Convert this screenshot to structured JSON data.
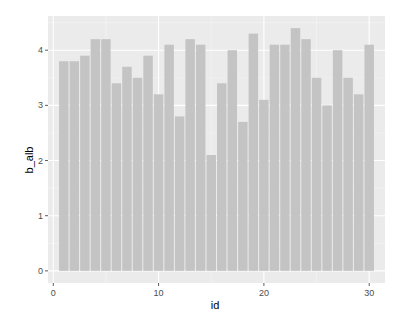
{
  "chart_data": {
    "type": "bar",
    "title": "",
    "xlabel": "id",
    "ylabel": "b_alb",
    "x": [
      1,
      2,
      3,
      4,
      5,
      6,
      7,
      8,
      9,
      10,
      11,
      12,
      13,
      14,
      15,
      16,
      17,
      18,
      19,
      20,
      21,
      22,
      23,
      24,
      25,
      26,
      27,
      28,
      29,
      30
    ],
    "values": [
      3.8,
      3.8,
      3.9,
      4.2,
      4.2,
      3.4,
      3.7,
      3.5,
      3.9,
      3.2,
      4.1,
      2.8,
      4.2,
      4.1,
      2.1,
      3.4,
      4.0,
      2.7,
      4.3,
      3.1,
      4.1,
      4.1,
      4.4,
      4.2,
      3.5,
      3.0,
      4.0,
      3.5,
      3.2,
      4.1
    ],
    "xlim": [
      -0.5,
      31.5
    ],
    "ylim": [
      -0.22,
      4.62
    ],
    "xticks": [
      0,
      10,
      20,
      30
    ],
    "xtick_labels": [
      "0",
      "10",
      "20",
      "30"
    ],
    "yticks": [
      0,
      1,
      2,
      3,
      4
    ],
    "ytick_labels": [
      "0",
      "1",
      "2",
      "3",
      "4"
    ],
    "grid": true,
    "legend": null,
    "colors": {
      "bar_fill": "#c4c4c4",
      "panel_bg": "#ebebeb",
      "grid_major": "#ffffff",
      "grid_minor": "#f5f5f5",
      "tick_text": "#4d4d4d",
      "axis_title": "#000000"
    }
  }
}
